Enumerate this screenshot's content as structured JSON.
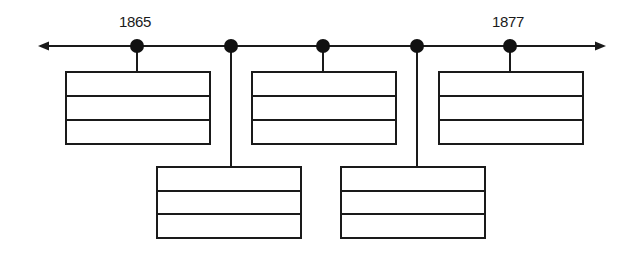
{
  "diagram": {
    "type": "timeline",
    "line_color": "#1a1a1a",
    "axis": {
      "start_label": "1865",
      "end_label": "1877",
      "arrows": "both"
    },
    "labels": [
      {
        "text": "1865",
        "x": 135,
        "y": 14
      },
      {
        "text": "1877",
        "x": 508,
        "y": 14
      }
    ],
    "events": [
      {
        "id": 1,
        "position": "above-row",
        "rows": [
          "",
          "",
          ""
        ]
      },
      {
        "id": 2,
        "position": "below-row",
        "rows": [
          "",
          "",
          ""
        ]
      },
      {
        "id": 3,
        "position": "above-row",
        "rows": [
          "",
          "",
          ""
        ]
      },
      {
        "id": 4,
        "position": "below-row",
        "rows": [
          "",
          "",
          ""
        ]
      },
      {
        "id": 5,
        "position": "above-row",
        "rows": [
          "",
          "",
          ""
        ]
      }
    ]
  }
}
